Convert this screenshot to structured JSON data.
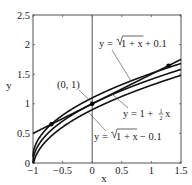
{
  "chart_data": {
    "type": "line",
    "title": "",
    "xlabel": "x",
    "ylabel": "y",
    "xlim": [
      -1,
      1.5
    ],
    "ylim": [
      0,
      2.5
    ],
    "grid": false,
    "xticks": [
      "−1",
      "−0.5",
      "0",
      "0.5",
      "1",
      "1.5"
    ],
    "yticks": [
      "0",
      "0.5",
      "1",
      "1.5",
      "2",
      "2.5"
    ],
    "series": [
      {
        "name": "y = √(1 + x) + 0.1",
        "expr": "sqrt(1+x)+0.1"
      },
      {
        "name": "y = √(1 + x)",
        "expr": "sqrt(1+x)"
      },
      {
        "name": "y = 1 + ½x",
        "expr": "1+0.5*x"
      },
      {
        "name": "y = √(1 + x) − 0.1",
        "expr": "sqrt(1+x)-0.1"
      }
    ],
    "points": [
      {
        "label": "(0, 1)",
        "x": 0,
        "y": 1
      },
      {
        "label": "",
        "x": -0.69,
        "y": 0.655
      },
      {
        "label": "",
        "x": 1.29,
        "y": 1.645
      }
    ],
    "annotations": [
      {
        "text": "(0, 1)",
        "points_to": [
          0,
          1
        ]
      },
      {
        "text": "y = √(1 + x) + 0.1",
        "points_to": "upper curve"
      },
      {
        "text": "y = 1 + ½x",
        "points_to": "tangent line"
      },
      {
        "text": "y = √(1 + x) − 0.1",
        "points_to": "lower curve"
      }
    ],
    "vertical_line": {
      "x": 0
    }
  },
  "labels": {
    "x_axis": "x",
    "y_axis": "y",
    "point": "(0, 1)",
    "upper_prefix": "y = ",
    "upper_radicand": "1 + x",
    "upper_suffix": " + 0.1",
    "tangent_prefix": "y = 1 + ",
    "tangent_frac_num": "1",
    "tangent_frac_den": "2",
    "tangent_suffix": "x",
    "lower_prefix": "y = ",
    "lower_radicand": "1 + x",
    "lower_suffix": "− 0.1"
  }
}
